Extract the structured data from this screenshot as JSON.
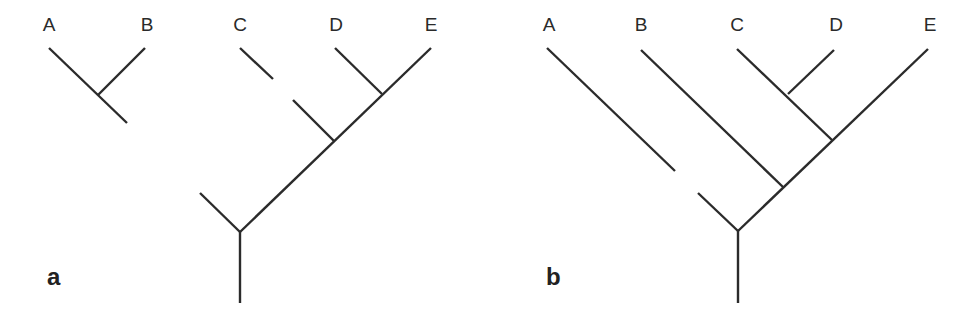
{
  "figure": {
    "line_color": "#2b2b2b",
    "background": "#ffffff"
  },
  "panels": [
    {
      "id": "a",
      "label": "a",
      "taxa": [
        "A",
        "B",
        "C",
        "D",
        "E"
      ],
      "topology": "((A,B)) ... (C,(D,E)) with root; A-B subtree and C branch shown disconnected",
      "taxon_labels": {
        "A": "A",
        "B": "B",
        "C": "C",
        "D": "D",
        "E": "E"
      }
    },
    {
      "id": "b",
      "label": "b",
      "taxa": [
        "A",
        "B",
        "C",
        "D",
        "E"
      ],
      "topology": "(A,(B,((C,D),E))) with A branch shown disconnected from root",
      "taxon_labels": {
        "A": "A",
        "B": "B",
        "C": "C",
        "D": "D",
        "E": "E"
      }
    }
  ]
}
